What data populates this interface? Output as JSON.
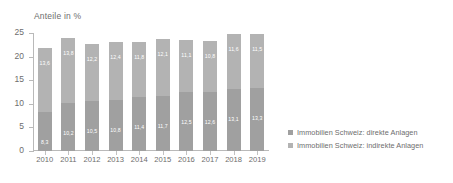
{
  "chart_data": {
    "type": "bar",
    "title": "Anteile in %",
    "xlabel": "",
    "ylabel": "Anteile in %",
    "ylim": [
      0,
      25
    ],
    "yticks": [
      0,
      5,
      10,
      15,
      20,
      25
    ],
    "ytick_labels": [
      "0",
      "5",
      "10",
      "15",
      "20",
      "25"
    ],
    "grid": false,
    "stacked": true,
    "legend_position": "right",
    "categories": [
      "2010",
      "2011",
      "2012",
      "2013",
      "2014",
      "2015",
      "2016",
      "2017",
      "2018",
      "2019"
    ],
    "series": [
      {
        "name": "Immobilien Schweiz: direkte Anlagen",
        "color": "#a0a0a0",
        "values": [
          8.3,
          10.2,
          10.5,
          10.8,
          11.4,
          11.7,
          12.5,
          12.6,
          13.1,
          13.3
        ],
        "labels": [
          "8,3",
          "10,2",
          "10,5",
          "10,8",
          "11,4",
          "11,7",
          "12,5",
          "12,6",
          "13,1",
          "13,3"
        ]
      },
      {
        "name": "Immobilien Schweiz: indirekte Anlagen",
        "color": "#b3b3b3",
        "values": [
          13.6,
          13.8,
          12.2,
          12.4,
          11.8,
          12.1,
          11.1,
          10.8,
          11.6,
          11.5
        ],
        "labels": [
          "13,6",
          "13,8",
          "12,2",
          "12,4",
          "11,8",
          "12,1",
          "11,1",
          "10,8",
          "11,6",
          "11,5"
        ]
      }
    ],
    "totals": [
      21.9,
      24.0,
      22.7,
      23.2,
      23.2,
      23.8,
      23.6,
      23.4,
      24.7,
      24.8
    ]
  },
  "legend": {
    "entries": [
      {
        "label": "Immobilien Schweiz: direkte Anlagen",
        "color": "#a0a0a0"
      },
      {
        "label": "Immobilien Schweiz: indirekte Anlagen",
        "color": "#b3b3b3"
      }
    ]
  },
  "colors": {
    "direkte": "#a0a0a0",
    "indirekte": "#b3b3b3",
    "axis": "#b9b9b9",
    "text": "#6d6d6d",
    "background": "#ffffff"
  }
}
